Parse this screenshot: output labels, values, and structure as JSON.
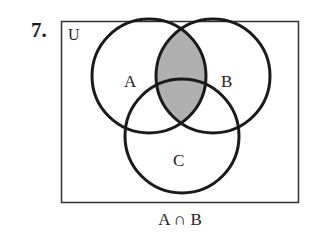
{
  "problem_number": "7.",
  "diagram": {
    "universe_label": "U",
    "sets": [
      {
        "label": "A",
        "cx": 149,
        "cy": 76,
        "r": 57
      },
      {
        "label": "B",
        "cx": 213,
        "cy": 76,
        "r": 57
      },
      {
        "label": "C",
        "cx": 182,
        "cy": 136,
        "r": 57
      }
    ],
    "shaded_region": "A ∩ B",
    "shade_color": "#b0b0b0",
    "stroke_color": "#1a1a1a"
  },
  "caption": "A ∩ B"
}
